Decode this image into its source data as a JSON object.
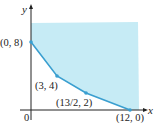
{
  "diagram": {
    "title": "",
    "axes": {
      "x_label": "x",
      "y_label": "y",
      "origin_label": "0"
    },
    "colors": {
      "region_fill": "#c6ebf5",
      "boundary": "#3a9fd0",
      "axis": "#222222"
    },
    "region": {
      "description": "unbounded feasible region above polygonal boundary"
    },
    "vertices": [
      {
        "label": "(0, 8)",
        "x": 0,
        "y": 8
      },
      {
        "label": "(3, 4)",
        "x": 3,
        "y": 4
      },
      {
        "label": "(13/2, 2)",
        "x": 6.5,
        "y": 2
      },
      {
        "label": "(12, 0)",
        "x": 12,
        "y": 0
      }
    ]
  }
}
